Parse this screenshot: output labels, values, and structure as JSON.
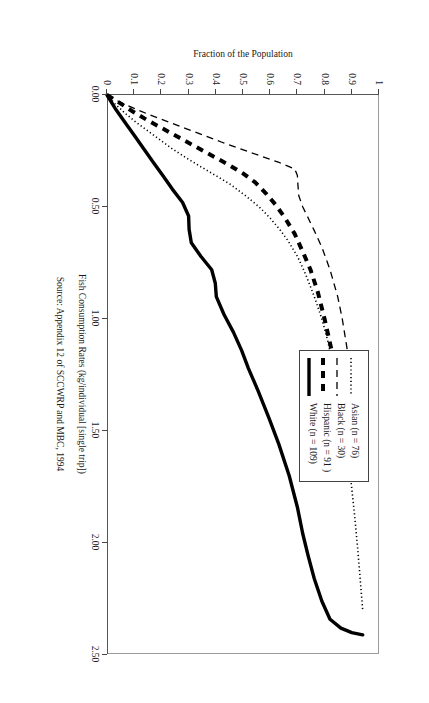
{
  "chart_data": {
    "type": "line",
    "title": "",
    "xlabel": "Fish Consumption Rates (kg/individual [single trip])",
    "ylabel": "Fraction of the Population",
    "source": "Source:  Appendix 12 of SCCWRP and MBC, 1994",
    "xlim": [
      0.0,
      2.5
    ],
    "ylim": [
      0.0,
      1.0
    ],
    "xticks": [
      "0.00",
      "0.50",
      "1.00",
      "1.50",
      "2.00",
      "2.50"
    ],
    "xtick_values": [
      0.0,
      0.5,
      1.0,
      1.5,
      2.0,
      2.5
    ],
    "yticks": [
      "0",
      "0.1",
      "0.2",
      "0.3",
      "0.4",
      "0.5",
      "0.6",
      "0.7",
      "0.8",
      "0.9",
      "1"
    ],
    "ytick_values": [
      0,
      0.1,
      0.2,
      0.3,
      0.4,
      0.5,
      0.6,
      0.7,
      0.8,
      0.9,
      1.0
    ],
    "grid": false,
    "legend_position": "top-right",
    "rotation_deg": 90,
    "series": [
      {
        "name": "Asian (n = 76)",
        "key_style": "dotted",
        "color": "#000000",
        "points": [
          [
            0.0,
            0.0
          ],
          [
            0.04,
            0.03
          ],
          [
            0.08,
            0.065
          ],
          [
            0.12,
            0.105
          ],
          [
            0.16,
            0.15
          ],
          [
            0.2,
            0.195
          ],
          [
            0.24,
            0.24
          ],
          [
            0.28,
            0.29
          ],
          [
            0.32,
            0.345
          ],
          [
            0.36,
            0.4
          ],
          [
            0.4,
            0.455
          ],
          [
            0.45,
            0.51
          ],
          [
            0.5,
            0.56
          ],
          [
            0.55,
            0.6
          ],
          [
            0.6,
            0.635
          ],
          [
            0.65,
            0.665
          ],
          [
            0.72,
            0.7
          ],
          [
            0.8,
            0.73
          ],
          [
            0.9,
            0.762
          ],
          [
            1.0,
            0.79
          ],
          [
            1.1,
            0.812
          ],
          [
            1.25,
            0.838
          ],
          [
            1.4,
            0.86
          ],
          [
            1.55,
            0.878
          ],
          [
            1.7,
            0.895
          ],
          [
            1.85,
            0.908
          ],
          [
            2.0,
            0.92
          ],
          [
            2.15,
            0.93
          ],
          [
            2.3,
            0.94
          ]
        ]
      },
      {
        "name": "Black (n = 30)",
        "key_style": "dashed",
        "color": "#000000",
        "points": [
          [
            0.0,
            0.0
          ],
          [
            0.03,
            0.045
          ],
          [
            0.06,
            0.1
          ],
          [
            0.09,
            0.16
          ],
          [
            0.12,
            0.225
          ],
          [
            0.15,
            0.29
          ],
          [
            0.18,
            0.355
          ],
          [
            0.21,
            0.42
          ],
          [
            0.24,
            0.49
          ],
          [
            0.27,
            0.56
          ],
          [
            0.3,
            0.63
          ],
          [
            0.33,
            0.69
          ],
          [
            0.36,
            0.7
          ],
          [
            0.4,
            0.702
          ],
          [
            0.45,
            0.705
          ],
          [
            0.5,
            0.72
          ],
          [
            0.55,
            0.74
          ],
          [
            0.6,
            0.76
          ],
          [
            0.68,
            0.79
          ],
          [
            0.78,
            0.82
          ],
          [
            0.9,
            0.848
          ],
          [
            1.0,
            0.865
          ],
          [
            1.15,
            0.885
          ],
          [
            1.3,
            0.905
          ],
          [
            1.45,
            0.93
          ]
        ]
      },
      {
        "name": "Hispanic (n = 91)",
        "key_style": "thick-dashed",
        "color": "#000000",
        "points": [
          [
            0.0,
            0.0
          ],
          [
            0.03,
            0.04
          ],
          [
            0.07,
            0.09
          ],
          [
            0.11,
            0.145
          ],
          [
            0.15,
            0.205
          ],
          [
            0.19,
            0.265
          ],
          [
            0.23,
            0.325
          ],
          [
            0.27,
            0.385
          ],
          [
            0.31,
            0.445
          ],
          [
            0.35,
            0.5
          ],
          [
            0.39,
            0.545
          ],
          [
            0.44,
            0.585
          ],
          [
            0.49,
            0.62
          ],
          [
            0.55,
            0.655
          ],
          [
            0.62,
            0.69
          ],
          [
            0.7,
            0.72
          ],
          [
            0.78,
            0.748
          ],
          [
            0.88,
            0.775
          ],
          [
            1.0,
            0.8
          ],
          [
            1.12,
            0.822
          ],
          [
            1.25,
            0.845
          ],
          [
            1.38,
            0.87
          ],
          [
            1.5,
            0.895
          ],
          [
            1.58,
            0.925
          ]
        ]
      },
      {
        "name": "White (n = 109)",
        "key_style": "solid",
        "color": "#000000",
        "points": [
          [
            0.0,
            0.0
          ],
          [
            0.06,
            0.03
          ],
          [
            0.12,
            0.065
          ],
          [
            0.18,
            0.1
          ],
          [
            0.24,
            0.135
          ],
          [
            0.3,
            0.17
          ],
          [
            0.36,
            0.205
          ],
          [
            0.42,
            0.24
          ],
          [
            0.48,
            0.278
          ],
          [
            0.54,
            0.3
          ],
          [
            0.6,
            0.302
          ],
          [
            0.66,
            0.31
          ],
          [
            0.72,
            0.345
          ],
          [
            0.78,
            0.385
          ],
          [
            0.84,
            0.398
          ],
          [
            0.9,
            0.402
          ],
          [
            0.98,
            0.43
          ],
          [
            1.06,
            0.465
          ],
          [
            1.14,
            0.495
          ],
          [
            1.22,
            0.52
          ],
          [
            1.32,
            0.555
          ],
          [
            1.44,
            0.595
          ],
          [
            1.56,
            0.632
          ],
          [
            1.7,
            0.67
          ],
          [
            1.84,
            0.7
          ],
          [
            1.96,
            0.72
          ],
          [
            2.06,
            0.74
          ],
          [
            2.16,
            0.762
          ],
          [
            2.26,
            0.79
          ],
          [
            2.34,
            0.82
          ],
          [
            2.38,
            0.86
          ],
          [
            2.4,
            0.9
          ],
          [
            2.41,
            0.94
          ]
        ]
      }
    ]
  },
  "legend": {
    "items": [
      {
        "label": "Asian (n = 76)"
      },
      {
        "label": "Black (n = 30)"
      },
      {
        "label": "Hispanic (n = 91 )"
      },
      {
        "label": "White (n = 109)"
      }
    ]
  }
}
